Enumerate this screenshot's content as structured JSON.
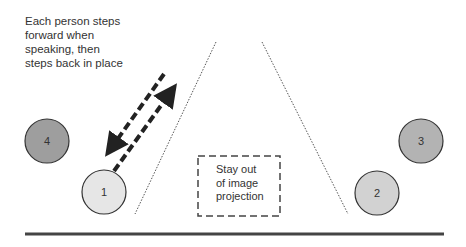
{
  "diagram": {
    "note": "Each person steps\nforward when\nspeaking, then\nsteps back in place",
    "no_go_zone": {
      "label": "Stay out\nof image\nprojection",
      "border_color": "#444444"
    },
    "people": [
      {
        "id": "1",
        "label": "1",
        "fill": "#e6e6e6",
        "cx": 104,
        "cy": 192,
        "r": 22
      },
      {
        "id": "2",
        "label": "2",
        "fill": "#d2d2d2",
        "cx": 377,
        "cy": 193,
        "r": 22
      },
      {
        "id": "3",
        "label": "3",
        "fill": "#b3b3b3",
        "cx": 421,
        "cy": 141,
        "r": 22
      },
      {
        "id": "4",
        "label": "4",
        "fill": "#9e9e9e",
        "cx": 47,
        "cy": 141,
        "r": 22
      }
    ],
    "colors": {
      "outline": "#333333",
      "arrow": "#222222",
      "projection_lines": "#555555",
      "stage_edge": "#444444"
    },
    "arrows": [
      {
        "direction": "to-speaking-position",
        "label": "forward"
      },
      {
        "direction": "back-to-place",
        "label": "back"
      }
    ]
  }
}
